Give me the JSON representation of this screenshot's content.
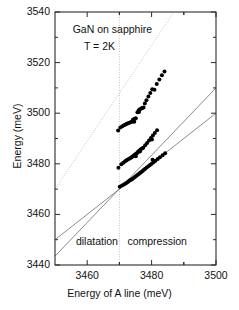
{
  "chart_data": {
    "type": "scatter",
    "title": "",
    "xlabel": "Energy of A line (meV)",
    "ylabel": "Energy (meV)",
    "xlim": [
      3450,
      3500
    ],
    "ylim": [
      3440,
      3540
    ],
    "xticks": [
      3460,
      3480,
      3500
    ],
    "yticks": [
      3440,
      3460,
      3480,
      3500,
      3520,
      3540
    ],
    "xtick_labels": [
      "3460",
      "3480",
      "3500"
    ],
    "ytick_labels": [
      "3440",
      "3460",
      "3480",
      "3500",
      "3520",
      "3540"
    ],
    "grid": false,
    "legend": null,
    "annotations": [
      {
        "text": "GaN on sapphire",
        "x": 3455.5,
        "y": 3533
      },
      {
        "text": "T = 2K",
        "x": 3459.0,
        "y": 3526
      },
      {
        "text": "dilatation",
        "x": 3456.5,
        "y": 3449
      },
      {
        "text": "compression",
        "x": 3472.5,
        "y": 3449
      }
    ],
    "reference_lines": [
      {
        "name": "strain-free-vertical",
        "type": "vertical",
        "x": 3470,
        "style": "dotted"
      },
      {
        "name": "identity-line",
        "type": "diagonal",
        "style": "dotted",
        "p1": [
          3450,
          3470
        ],
        "p2": [
          3488,
          3542
        ]
      },
      {
        "name": "b-line-fit",
        "type": "diagonal",
        "style": "solid",
        "p1": [
          3450,
          3443.5
        ],
        "p2": [
          3500,
          3510
        ]
      },
      {
        "name": "c-line-fit",
        "type": "diagonal",
        "style": "solid",
        "p1": [
          3450,
          3450
        ],
        "p2": [
          3500,
          3500
        ]
      }
    ],
    "series": [
      {
        "name": "C exciton",
        "marker": "filled-circle",
        "color": "#000000",
        "points": [
          [
            3469.6,
            3493.2
          ],
          [
            3470.3,
            3494.3
          ],
          [
            3470.9,
            3494.8
          ],
          [
            3471.4,
            3495.2
          ],
          [
            3471.9,
            3495.5
          ],
          [
            3472.3,
            3495.8
          ],
          [
            3472.7,
            3496.0
          ],
          [
            3473.1,
            3496.2
          ],
          [
            3473.5,
            3496.4
          ],
          [
            3473.9,
            3496.6
          ],
          [
            3474.2,
            3497.4
          ],
          [
            3474.5,
            3497.6
          ],
          [
            3474.8,
            3497.8
          ],
          [
            3475.1,
            3498.0
          ],
          [
            3474.6,
            3496.6
          ],
          [
            3475.6,
            3500.4
          ],
          [
            3476.0,
            3501.2
          ],
          [
            3476.4,
            3501.6
          ],
          [
            3476.8,
            3501.9
          ],
          [
            3477.1,
            3502.1
          ],
          [
            3477.5,
            3502.3
          ],
          [
            3476.1,
            3500.5
          ],
          [
            3477.9,
            3503.8
          ],
          [
            3478.4,
            3505.1
          ],
          [
            3479.0,
            3506.6
          ],
          [
            3479.6,
            3508.0
          ],
          [
            3480.2,
            3509.5
          ],
          [
            3480.9,
            3509.3
          ],
          [
            3481.6,
            3511.5
          ],
          [
            3482.4,
            3513.3
          ],
          [
            3483.2,
            3515.0
          ],
          [
            3484.0,
            3516.5
          ]
        ]
      },
      {
        "name": "B exciton",
        "marker": "filled-circle",
        "color": "#000000",
        "points": [
          [
            3469.7,
            3478.4
          ],
          [
            3470.6,
            3479.8
          ],
          [
            3471.2,
            3480.4
          ],
          [
            3471.7,
            3480.9
          ],
          [
            3472.1,
            3481.3
          ],
          [
            3472.5,
            3481.6
          ],
          [
            3472.9,
            3481.9
          ],
          [
            3473.3,
            3482.2
          ],
          [
            3473.7,
            3482.5
          ],
          [
            3474.0,
            3482.8
          ],
          [
            3474.3,
            3483.1
          ],
          [
            3474.6,
            3483.4
          ],
          [
            3474.9,
            3483.7
          ],
          [
            3475.2,
            3484.0
          ],
          [
            3475.5,
            3484.3
          ],
          [
            3475.1,
            3483.0
          ],
          [
            3475.8,
            3484.8
          ],
          [
            3476.2,
            3485.3
          ],
          [
            3476.6,
            3485.7
          ],
          [
            3477.0,
            3486.0
          ],
          [
            3477.4,
            3486.3
          ],
          [
            3476.4,
            3484.9
          ],
          [
            3478.0,
            3487.3
          ],
          [
            3478.6,
            3488.2
          ],
          [
            3479.2,
            3489.2
          ],
          [
            3479.8,
            3490.2
          ],
          [
            3480.4,
            3491.2
          ],
          [
            3481.0,
            3492.2
          ],
          [
            3480.1,
            3489.6
          ],
          [
            3481.7,
            3493.3
          ]
        ]
      },
      {
        "name": "A exciton",
        "marker": "filled-circle",
        "color": "#000000",
        "points": [
          [
            3470.1,
            3470.9
          ],
          [
            3470.8,
            3471.4
          ],
          [
            3471.4,
            3471.8
          ],
          [
            3471.9,
            3472.2
          ],
          [
            3472.4,
            3472.6
          ],
          [
            3472.8,
            3473.0
          ],
          [
            3473.2,
            3473.4
          ],
          [
            3473.6,
            3473.7
          ],
          [
            3474.0,
            3474.0
          ],
          [
            3474.4,
            3474.4
          ],
          [
            3474.8,
            3474.8
          ],
          [
            3475.2,
            3475.2
          ],
          [
            3475.6,
            3475.6
          ],
          [
            3476.0,
            3476.0
          ],
          [
            3476.4,
            3476.4
          ],
          [
            3476.8,
            3476.8
          ],
          [
            3477.2,
            3477.2
          ],
          [
            3477.6,
            3477.6
          ],
          [
            3478.0,
            3478.0
          ],
          [
            3478.5,
            3478.5
          ],
          [
            3479.0,
            3479.0
          ],
          [
            3479.5,
            3479.5
          ],
          [
            3480.0,
            3480.0
          ],
          [
            3480.6,
            3480.6
          ],
          [
            3481.2,
            3481.2
          ],
          [
            3481.9,
            3481.9
          ],
          [
            3482.6,
            3482.6
          ],
          [
            3483.4,
            3483.4
          ],
          [
            3484.2,
            3484.2
          ],
          [
            3480.3,
            3481.6
          ]
        ]
      }
    ]
  },
  "axis": {
    "x_title": "Energy of A line (meV)",
    "y_title": "Energy (meV)"
  }
}
